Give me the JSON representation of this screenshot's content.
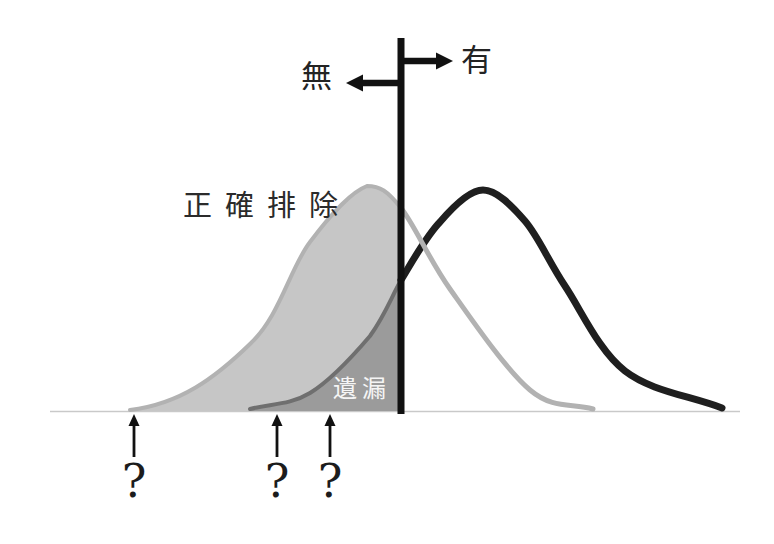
{
  "figure": {
    "threshold": {
      "right_arrow_label": "有",
      "left_arrow_label": "無"
    },
    "regions": {
      "correct_rejection_label": "正確排除",
      "miss_label": "遺漏"
    },
    "cutoff_marks": [
      {
        "label": "?"
      },
      {
        "label": "?"
      },
      {
        "label": "?"
      }
    ],
    "colors": {
      "absent_fill": "#c6c6c6",
      "absent_stroke": "#b2b2b2",
      "overlap_fill": "#9b9b9b",
      "overlap_stroke": "#6f6f6f",
      "present_curve": "#1f1f1f",
      "threshold_line": "#111111",
      "arrow_color": "#111111",
      "baseline": "#c9c9c9",
      "miss_label_color": "#f5f5f5"
    }
  }
}
